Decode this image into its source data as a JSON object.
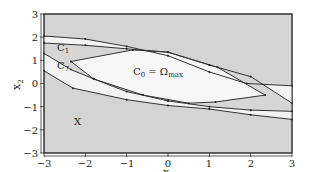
{
  "chart_data": {
    "type": "area",
    "title": "",
    "xlabel": "x1",
    "ylabel": "x2",
    "xlim": [
      -3,
      3
    ],
    "ylim": [
      -3,
      3
    ],
    "xticks": [
      -3,
      -2,
      -1,
      0,
      1,
      2,
      3
    ],
    "yticks": [
      -3,
      -2,
      -1,
      0,
      1,
      2,
      3
    ],
    "grid": false,
    "legend": null,
    "background_region_label": "X",
    "colors": {
      "outer_region": "#d4d4d4",
      "band_region": "#f4f4f4",
      "inner_region": "#f8f8f8",
      "c1_gap_region": "#d8d8d8",
      "lines": "#333333"
    },
    "annotations": [
      {
        "text": "C",
        "sub": "1",
        "x1": -2.2,
        "x2": 1.15
      },
      {
        "text": "C",
        "sub": "7",
        "x1": -2.2,
        "x2": 0.4
      },
      {
        "text": "C",
        "sub": "0",
        "suffix": " = Ω",
        "suffix_sub": "max",
        "x1": 0.15,
        "x2": 0.3
      },
      {
        "text": "X",
        "x1": -2.2,
        "x2": -2.0
      }
    ],
    "series": [
      {
        "name": "C7",
        "upper": [
          [
            -3,
            2.05
          ],
          [
            -2,
            1.92
          ],
          [
            -1,
            1.6
          ],
          [
            0,
            1.2
          ],
          [
            1,
            0.5
          ],
          [
            1.9,
            0.0
          ],
          [
            3,
            -0.1
          ]
        ],
        "lower": [
          [
            -3,
            0.55
          ],
          [
            -2.3,
            -0.2
          ],
          [
            -1,
            -0.7
          ],
          [
            0,
            -0.95
          ],
          [
            1,
            -1.1
          ],
          [
            2,
            -1.35
          ],
          [
            3,
            -1.55
          ]
        ]
      },
      {
        "name": "C1",
        "upper": [
          [
            -3,
            1.75
          ],
          [
            -2,
            1.65
          ],
          [
            -1,
            1.5
          ],
          [
            0,
            1.35
          ],
          [
            1,
            0.8
          ],
          [
            2,
            0.3
          ],
          [
            3,
            -0.85
          ]
        ],
        "lower": [
          [
            -3,
            1.3
          ],
          [
            -2.35,
            0.6
          ],
          [
            -1.8,
            0.2
          ],
          [
            -1,
            -0.35
          ],
          [
            0,
            -0.75
          ],
          [
            1,
            -1.0
          ],
          [
            2,
            -1.15
          ],
          [
            3,
            -1.2
          ]
        ]
      },
      {
        "name": "C0 = Omega_max",
        "polygon": [
          [
            -2.35,
            0.95
          ],
          [
            -0.85,
            1.45
          ],
          [
            0,
            1.35
          ],
          [
            1.2,
            0.7
          ],
          [
            2.35,
            -0.5
          ],
          [
            1.15,
            -0.8
          ],
          [
            0.5,
            -0.85
          ],
          [
            -0.6,
            -0.5
          ],
          [
            -1.8,
            0.2
          ]
        ]
      }
    ]
  },
  "axes": {
    "xlabel_main": "x",
    "xlabel_sub": "1",
    "ylabel_main": "x",
    "ylabel_sub": "2",
    "xtick_labels": [
      "−3",
      "−2",
      "−1",
      "0",
      "1",
      "2",
      "3"
    ],
    "ytick_labels": [
      "3",
      "2",
      "1",
      "0",
      "−1",
      "−2",
      "−3"
    ]
  },
  "labels": {
    "c1_main": "C",
    "c1_sub": "1",
    "c7_main": "C",
    "c7_sub": "7",
    "c0_main": "C",
    "c0_sub": "0",
    "c0_eq": " = Ω",
    "c0_eq_sub": "max",
    "x_region": "X"
  }
}
